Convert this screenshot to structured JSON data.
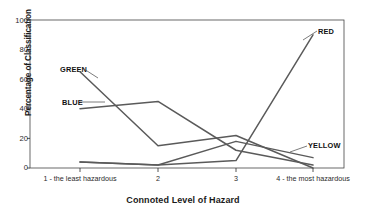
{
  "chart_data": {
    "type": "line",
    "title": "",
    "xlabel": "Connoted Level of Hazard",
    "ylabel": "Percentage of Classification",
    "categories": [
      "1 - the least hazardous",
      "2",
      "3",
      "4 - the most hazardous"
    ],
    "category_short": [
      "1",
      "2",
      "3",
      "4"
    ],
    "ylim": [
      0,
      100
    ],
    "y_ticks": [
      0,
      20,
      40,
      60,
      80,
      100
    ],
    "grid": false,
    "legend_position": "inline-labels",
    "series": [
      {
        "name": "GREEN",
        "values": [
          65,
          15,
          22,
          0
        ]
      },
      {
        "name": "BLUE",
        "values": [
          40,
          45,
          12,
          2
        ]
      },
      {
        "name": "RED",
        "values": [
          4,
          2,
          5,
          90
        ]
      },
      {
        "name": "YELLOW",
        "values": [
          4,
          2,
          18,
          7
        ]
      }
    ]
  },
  "axis": {
    "y_title": "Percentage of Classification",
    "x_title": "Connoted Level of Hazard",
    "y_tick_labels": [
      "0",
      "20",
      "40",
      "60",
      "80",
      "100"
    ],
    "x_tick_labels": [
      "1 - the least hazardous",
      "2",
      "3",
      "4 - the most hazardous"
    ]
  },
  "labels": {
    "green": "GREEN",
    "blue": "BLUE",
    "red": "RED",
    "yellow": "YELLOW"
  },
  "colors": {
    "line": "#5a5a5a",
    "axis": "#2b2b2b",
    "text": "#1a1a1a",
    "background": "#ffffff"
  }
}
